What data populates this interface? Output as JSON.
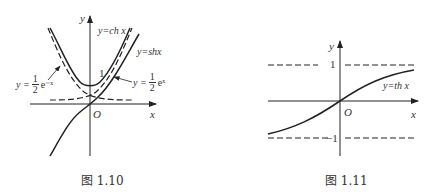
{
  "figures": [
    {
      "id": "fig-1-10",
      "caption": "图 1.10",
      "axis_x_label": "x",
      "axis_y_label": "y",
      "origin_label": "O",
      "tick_one": "1",
      "curves": {
        "ch": "y=ch x",
        "sh": "y=shx",
        "half_exp_neg": {
          "lhs": "y =",
          "num": "1",
          "den": "2",
          "rhs": "e⁻ˣ"
        },
        "half_exp_pos": {
          "lhs": "y =",
          "num": "1",
          "den": "2",
          "rhs": "eˣ"
        }
      }
    },
    {
      "id": "fig-1-11",
      "caption": "图 1.11",
      "axis_x_label": "x",
      "axis_y_label": "y",
      "origin_label": "O",
      "tick_pos_one": "1",
      "tick_neg_one": "−1",
      "curves": {
        "th": "y=th x"
      }
    }
  ]
}
